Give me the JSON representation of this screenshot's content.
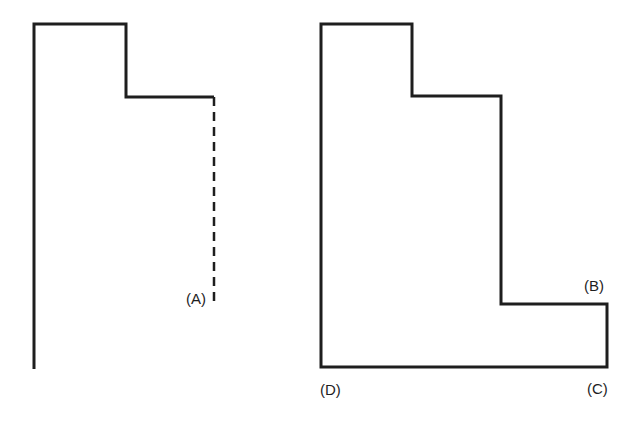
{
  "figure_left": {
    "label_a": "(A)",
    "solid_path": "M34,369 L34,24 L126,24 L126,97 L214,97",
    "dashed_path": "M214,97 L214,306",
    "stroke_color": "#1e1e1e"
  },
  "figure_right": {
    "label_b": "(B)",
    "label_c": "(C)",
    "label_d": "(D)",
    "outline_path": "M321,24 L412,24 L412,96 L501,96 L501,304 L607,304 L607,367 L321,367 Z",
    "stroke_color": "#1e1e1e"
  }
}
